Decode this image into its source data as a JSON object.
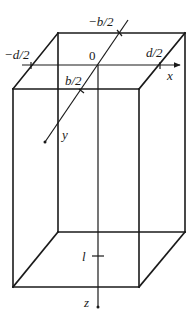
{
  "figure": {
    "type": "rectangular-prism-with-coordinate-axes",
    "labels": {
      "origin": "0",
      "neg_b_half": "−b/2",
      "pos_b_half": "b/2",
      "neg_d_half": "−d/2",
      "pos_d_half": "d/2",
      "x_axis": "x",
      "y_axis": "y",
      "z_axis": "z",
      "length": "l"
    },
    "colors": {
      "line": "#1a1a1a",
      "background": "#ffffff"
    }
  }
}
